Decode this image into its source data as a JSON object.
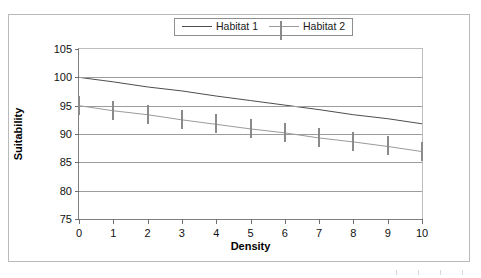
{
  "chart_data": {
    "type": "line",
    "title": "",
    "xlabel": "Density",
    "ylabel": "Suitability",
    "xlim": [
      0,
      10
    ],
    "ylim": [
      75,
      105
    ],
    "xticks": [
      0,
      1,
      2,
      3,
      4,
      5,
      6,
      7,
      8,
      9,
      10
    ],
    "yticks": [
      75,
      80,
      85,
      90,
      95,
      100,
      105
    ],
    "grid": "horizontal",
    "legend_position": "top-center",
    "x": [
      0,
      1,
      2,
      3,
      4,
      5,
      6,
      7,
      8,
      9,
      10
    ],
    "series": [
      {
        "name": "Habitat 1",
        "marker": "filled-diamond",
        "color": "#000000",
        "line_color": "#4d4d4d",
        "values": [
          100.0,
          99.2,
          98.3,
          97.6,
          96.7,
          95.9,
          95.1,
          94.3,
          93.4,
          92.7,
          91.8
        ]
      },
      {
        "name": "Habitat 2",
        "marker": "open-square",
        "color": "#ffffff",
        "line_color": "#9a9a9a",
        "values": [
          95.0,
          94.1,
          93.4,
          92.5,
          91.7,
          90.9,
          90.2,
          89.3,
          88.6,
          87.8,
          86.9
        ]
      }
    ]
  },
  "legend": {
    "entries": [
      {
        "label": "Habitat 1"
      },
      {
        "label": "Habitat 2"
      }
    ]
  },
  "axes": {
    "x_title": "Density",
    "y_title": "Suitability"
  }
}
